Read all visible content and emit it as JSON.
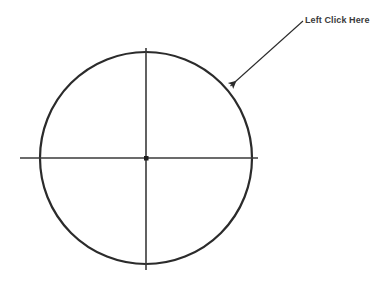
{
  "canvas": {
    "width": 389,
    "height": 288,
    "background_color": "#ffffff"
  },
  "diagram": {
    "stroke_color": "#2b2b2b",
    "line_color": "#3a3a3a",
    "circle": {
      "name": "target-circle",
      "center_x": 146,
      "center_y": 158,
      "radius": 106,
      "stroke_width": 2.2
    },
    "horizontal_axis": {
      "name": "horizontal-crosshair-line",
      "x1": 20,
      "x2": 258,
      "y": 158,
      "stroke_width": 1.6
    },
    "vertical_axis": {
      "name": "vertical-crosshair-line",
      "y1": 48,
      "y2": 270,
      "x": 146,
      "stroke_width": 1.6
    },
    "center_point": {
      "name": "center-dot",
      "x": 146,
      "y": 158,
      "size": 4
    }
  },
  "annotation": {
    "label": "Left Click Here",
    "label_x": 305,
    "label_y": 15,
    "text_color": "#3a3a3a",
    "arrow": {
      "name": "callout-arrow",
      "tail_x": 303,
      "tail_y": 21,
      "tip_x": 228,
      "tip_y": 88,
      "stroke_width": 1.1,
      "color": "#2b2b2b"
    }
  }
}
